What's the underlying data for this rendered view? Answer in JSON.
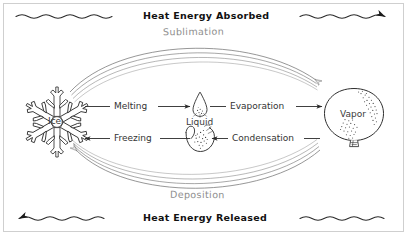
{
  "diagram": {
    "title_top": "Heat Energy Absorbed",
    "title_bottom": "Heat Energy Released",
    "phases": [
      {
        "id": "ice",
        "label": "Ice",
        "icon": "snowflake-icon"
      },
      {
        "id": "liquid",
        "label": "Liquid",
        "icon": "water-droplet-icon"
      },
      {
        "id": "vapor",
        "label": "Vapor",
        "icon": "balloon-icon"
      }
    ],
    "transitions": [
      {
        "id": "melting",
        "label": "Melting",
        "from": "ice",
        "to": "vapor_side",
        "direction": "right"
      },
      {
        "id": "evaporation",
        "label": "Evaporation",
        "from": "liquid",
        "to": "vapor",
        "direction": "right"
      },
      {
        "id": "freezing",
        "label": "Freezing",
        "from": "liquid",
        "to": "ice",
        "direction": "left"
      },
      {
        "id": "condensation",
        "label": "Condensation",
        "from": "vapor",
        "to": "liquid",
        "direction": "left"
      },
      {
        "id": "sublimation",
        "label": "Sublimation",
        "from": "ice",
        "to": "vapor",
        "direction": "right"
      },
      {
        "id": "deposition",
        "label": "Deposition",
        "from": "vapor",
        "to": "ice",
        "direction": "left"
      }
    ],
    "energy_flow": {
      "top_direction": "right",
      "bottom_direction": "left"
    },
    "colors": {
      "ink": "#1a1a1a",
      "arc_ink": "#6e6e6e",
      "label_gray": "#8d8d8d",
      "background": "#ffffff"
    }
  }
}
